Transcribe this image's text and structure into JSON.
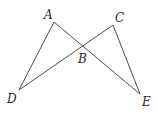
{
  "diagram": {
    "type": "geometry",
    "stroke_color": "#3a3a3a",
    "points": {
      "A": {
        "label": "A",
        "x": 54,
        "y": 22,
        "label_x": 44,
        "label_y": 19
      },
      "B": {
        "label": "B",
        "x": 83,
        "y": 46,
        "label_x": 78,
        "label_y": 63
      },
      "C": {
        "label": "C",
        "x": 113,
        "y": 25,
        "label_x": 115,
        "label_y": 22
      },
      "D": {
        "label": "D",
        "x": 19,
        "y": 90,
        "label_x": 7,
        "label_y": 103
      },
      "E": {
        "label": "E",
        "x": 140,
        "y": 94,
        "label_x": 142,
        "label_y": 106
      }
    },
    "segments": [
      {
        "from": "A",
        "to": "D"
      },
      {
        "from": "A",
        "to": "E"
      },
      {
        "from": "C",
        "to": "D"
      },
      {
        "from": "C",
        "to": "E"
      }
    ]
  }
}
